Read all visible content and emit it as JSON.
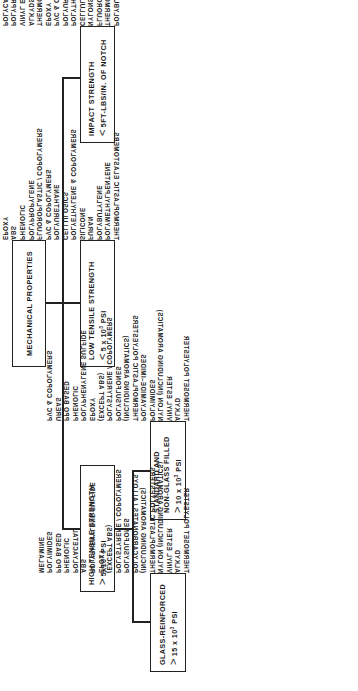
{
  "root": {
    "title": "MECHANICAL PROPERTIES"
  },
  "impact_strength": {
    "title": "IMPACT STRENGTH",
    "criterion_symbol": "<",
    "criterion": "5FT-LBS/IN. OF NOTCH",
    "materials": [
      "POLYBUTYLENES",
      "THERMOPLASTIC ELASTOMERS",
      "FLUOROPLASTICS",
      "NYLONS",
      "CELLULOSICS",
      "POLYTHYLENE & COPOLYMERS",
      "POLYURETHANE",
      "PVC & COPOLYMERS",
      "EPOXY",
      "THERMOSETTING POLYESTERS",
      "ALKYDS",
      "VINYL ESTERS",
      "POLYPROPYLENE",
      "POLYCARBONATE",
      "MELAMINES",
      "PHENOLIC",
      "POLYIMIDE",
      "ALLYLS",
      "ACRYLIC",
      "ABS",
      "PPO BASED",
      "POLYARYL ETHOR",
      "GLASS-REINFORCED SILICONE",
      "POLYSTYRENE COPOLYMERS"
    ]
  },
  "low_tensile_strength": {
    "title": "LOW TENSILE STRENGTH",
    "criterion_symbol": "<",
    "criterion_base": "5 x 10",
    "criterion_exp": "3",
    "criterion_unit": "PSI",
    "materials": [
      "THERMOPLASTIC ELASTOMERS",
      "POLYMETHYLPENTENE",
      "POLYBUTYLENE",
      "FURAN",
      "SILICONE",
      "POLYETHYLENE & COPOLYMERS",
      "CELLULOSICS",
      "POLYURETHANE",
      "PVC & COPOLYMERS",
      "FLUOROPLASTIC / COPOLYMERS",
      "POLYPROPYLENE",
      "PHENOLIC",
      "ABS",
      "EPOXY",
      "POLYSTYRENE",
      "THERMOPLASTIC POLYESTERS",
      "POLYAMIDE-IMIDES",
      "POLYIMIDES",
      "ALKYD",
      "VINYL ESTER"
    ]
  },
  "high_tensile_strength": {
    "title": "HIGH TENSILE STRENGTH",
    "criterion_symbol": ">",
    "criterion_base": "5x10",
    "criterion_exp": "3",
    "criterion_unit": "PSI",
    "standard": {
      "title_line1": "STANDARD AND",
      "title_line2": "NON-GLASS FILLED",
      "criterion_symbol": ">",
      "criterion_base": "10 x 10",
      "criterion_exp": "3",
      "criterion_unit": "PSI",
      "materials": [
        "THERMOSET POLYESTER",
        "ALKYD",
        "VINYL ESTER",
        "NYLON (INCLUDING AROMATICS)",
        "POLYIMIDES",
        "POLYAMIDE–IMIDES",
        "THERMOPLASTIC POLYESTERS",
        "(INCLUDING AROMATICS)",
        "POLYSULFONES",
        "POLYSTYRENE / COPOLYMERS",
        "(EXCEPT ABS)",
        "EPOXY",
        "POLYPHENYLENE SULFIDE",
        "PHENOLIC",
        "PPO BASED",
        "UREAS",
        "PVC & COPOLYMERS"
      ]
    },
    "glass_reinforced": {
      "title": "GLASS-REINFORCED",
      "criterion_symbol": ">",
      "criterion_base": "15 x 10",
      "criterion_exp": "3",
      "criterion_unit": "PSI",
      "materials": [
        "THERMOSET POLYESTER",
        "ALKYD",
        "VINYL ESTER",
        "NYLON (INCLUDING AROMATICS)",
        "THERMOPLASTIC POLYESTERS",
        "(INCLUDING AROMATICS)",
        "POLYCARBONATES / ALLOYS",
        "POLYSULFONES",
        "POLYSTYRENE / COPOLYMERS",
        "(EXCEPT ABS)",
        "EPOXY",
        "POLYPHENYLENE SULFIDE",
        "ABS",
        "POLYACETAL",
        "PHENOLIC",
        "PPO BASED",
        "POLYIMIDES",
        "MELAMINE"
      ]
    }
  }
}
